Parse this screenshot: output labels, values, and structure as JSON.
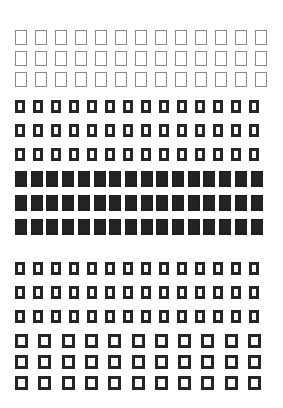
{
  "page": {
    "background": "#ffffff",
    "header_fragment": "cropped header text (not legible)"
  },
  "sections": [
    {
      "name": "thin-outline-squares",
      "style": "outline-thin",
      "color": "#8a8a8a",
      "rows": 3,
      "cols": 13,
      "x0": 15,
      "y0": 30,
      "cell_w": 12,
      "cell_h": 15,
      "pitch_x": 20,
      "pitch_y": 21
    },
    {
      "name": "thick-outline-narrow-squares",
      "style": "outline-thick",
      "color": "#262626",
      "rows": 3,
      "cols": 14,
      "x0": 15,
      "y0": 100,
      "cell_w": 10,
      "cell_h": 13,
      "pitch_x": 18,
      "pitch_y": 24,
      "border": 3
    },
    {
      "name": "filled-squares",
      "style": "filled",
      "color": "#232323",
      "rows": 3,
      "cols": 16,
      "x0": 15,
      "y0": 171,
      "cell_w": 12,
      "cell_h": 16,
      "pitch_x": 15.7,
      "pitch_y": 24
    },
    {
      "name": "thick-outline-narrow-squares-2",
      "style": "outline-thick",
      "color": "#262626",
      "rows": 3,
      "cols": 14,
      "x0": 15,
      "y0": 262,
      "cell_w": 10,
      "cell_h": 13,
      "pitch_x": 18,
      "pitch_y": 24,
      "border": 3
    },
    {
      "name": "thick-outline-wide-squares",
      "style": "outline-thick",
      "color": "#262626",
      "rows": 3,
      "cols": 11,
      "x0": 15,
      "y0": 334,
      "cell_w": 13,
      "cell_h": 14,
      "pitch_x": 23.3,
      "pitch_y": 21,
      "border": 3
    }
  ]
}
